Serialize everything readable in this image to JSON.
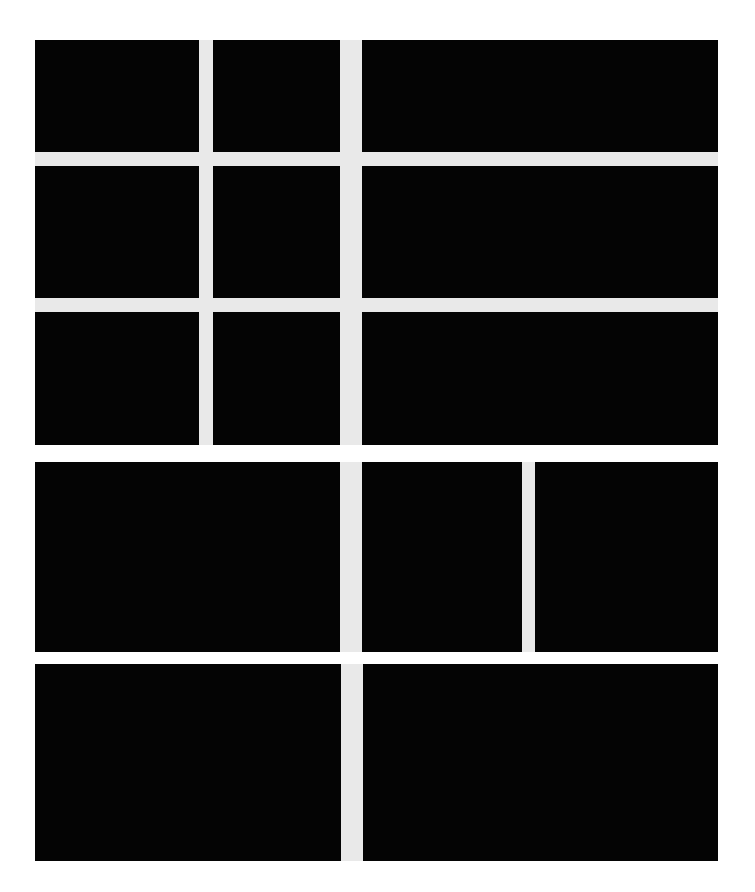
{
  "canvas": {
    "width": 755,
    "height": 892,
    "background_color": "#ffffff",
    "gutter_color": "#e9e9e9",
    "panel_color": "#040404"
  },
  "content_area": {
    "left": 35,
    "top": 40,
    "right": 718,
    "bottom": 861
  },
  "grid": {
    "row_count": 5,
    "gutter_px": 14,
    "rows": [
      {
        "name": "row-1",
        "top": 40,
        "bottom": 152,
        "panel_count": 3
      },
      {
        "name": "row-2",
        "top": 166,
        "bottom": 298,
        "panel_count": 3
      },
      {
        "name": "row-3",
        "top": 312,
        "bottom": 445,
        "panel_count": 3
      },
      {
        "name": "row-4",
        "top": 462,
        "bottom": 652,
        "panel_count": 3
      },
      {
        "name": "row-5",
        "top": 664,
        "bottom": 861,
        "panel_count": 2
      }
    ]
  },
  "panels": [
    {
      "id": "panel-r1c1",
      "row": 1,
      "col": 1,
      "x": 35,
      "y": 40,
      "w": 164,
      "h": 112
    },
    {
      "id": "panel-r1c2",
      "row": 1,
      "col": 2,
      "x": 213,
      "y": 40,
      "w": 127,
      "h": 112
    },
    {
      "id": "panel-r1c3",
      "row": 1,
      "col": 3,
      "x": 362,
      "y": 40,
      "w": 356,
      "h": 112
    },
    {
      "id": "panel-r2c1",
      "row": 2,
      "col": 1,
      "x": 35,
      "y": 166,
      "w": 164,
      "h": 132
    },
    {
      "id": "panel-r2c2",
      "row": 2,
      "col": 2,
      "x": 213,
      "y": 166,
      "w": 127,
      "h": 132
    },
    {
      "id": "panel-r2c3",
      "row": 2,
      "col": 3,
      "x": 362,
      "y": 166,
      "w": 356,
      "h": 132
    },
    {
      "id": "panel-r3c1",
      "row": 3,
      "col": 1,
      "x": 35,
      "y": 312,
      "w": 164,
      "h": 133
    },
    {
      "id": "panel-r3c2",
      "row": 3,
      "col": 2,
      "x": 213,
      "y": 312,
      "w": 127,
      "h": 133
    },
    {
      "id": "panel-r3c3",
      "row": 3,
      "col": 3,
      "x": 362,
      "y": 312,
      "w": 356,
      "h": 133
    },
    {
      "id": "panel-r4c1",
      "row": 4,
      "col": 1,
      "x": 35,
      "y": 462,
      "w": 305,
      "h": 190
    },
    {
      "id": "panel-r4c2",
      "row": 4,
      "col": 2,
      "x": 362,
      "y": 462,
      "w": 160,
      "h": 190
    },
    {
      "id": "panel-r4c3",
      "row": 4,
      "col": 3,
      "x": 535,
      "y": 462,
      "w": 183,
      "h": 190
    },
    {
      "id": "panel-r5c1",
      "row": 5,
      "col": 1,
      "x": 35,
      "y": 664,
      "w": 306,
      "h": 197
    },
    {
      "id": "panel-r5c2",
      "row": 5,
      "col": 2,
      "x": 363,
      "y": 664,
      "w": 355,
      "h": 197
    }
  ],
  "gutter_fields": [
    {
      "id": "gutter-rows-1-3",
      "x": 35,
      "y": 40,
      "w": 683,
      "h": 405
    },
    {
      "id": "gutter-row-4",
      "x": 35,
      "y": 462,
      "w": 683,
      "h": 190
    },
    {
      "id": "gutter-row-5",
      "x": 35,
      "y": 664,
      "w": 683,
      "h": 197
    }
  ]
}
